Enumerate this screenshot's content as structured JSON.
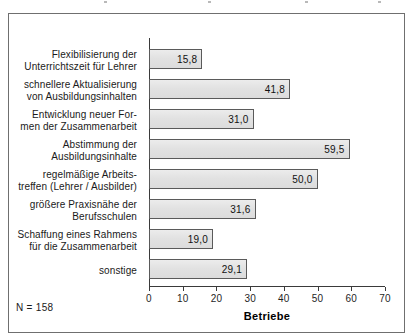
{
  "footnote": "N = 158",
  "axis": {
    "title": "Betriebe",
    "ticks": [
      "0",
      "10",
      "20",
      "30",
      "40",
      "50",
      "60",
      "70"
    ]
  },
  "colors": {
    "bar_fill": "#e4e4e4",
    "bar_border": "#5a5a5a",
    "frame": "#6f6f6f",
    "axis": "#3a3a3a",
    "text": "#1a1a1a"
  },
  "chart_data": {
    "type": "bar",
    "orientation": "horizontal",
    "title": "",
    "xlabel": "Betriebe",
    "ylabel": "",
    "xlim": [
      0,
      70
    ],
    "xticks": [
      0,
      10,
      20,
      30,
      40,
      50,
      60,
      70
    ],
    "grid": false,
    "legend": null,
    "note": "N = 158",
    "decimal_separator": ",",
    "categories": [
      "Flexibilisierung der Unterrichtszeit für Lehrer",
      "schnellere Aktualisierung von Ausbildungsinhalten",
      "Entwicklung neuer Formen der Zusammenarbeit",
      "Abstimmung der Ausbildungsinhalte",
      "regelmäßige Arbeitstreffen (Lehrer / Ausbilder)",
      "größere Praxisnähe der Berufsschulen",
      "Schaffung eines Rahmens für die Zusammenarbeit",
      "sonstige"
    ],
    "values": [
      15.8,
      41.8,
      31.0,
      59.5,
      50.0,
      31.6,
      19.0,
      29.1
    ],
    "value_labels": [
      "15,8",
      "41,8",
      "31,0",
      "59,5",
      "50,0",
      "31,6",
      "19,0",
      "29,1"
    ]
  },
  "rows": [
    {
      "line1": "Flexibilisierung der",
      "line2": "Unterrichtszeit für Lehrer",
      "value": 15.8,
      "value_label": "15,8"
    },
    {
      "line1": "schnellere Aktualisierung",
      "line2": "von Ausbildungsinhalten",
      "value": 41.8,
      "value_label": "41,8"
    },
    {
      "line1": "Entwicklung neuer For-",
      "line2": "men der Zusammenarbeit",
      "value": 31.0,
      "value_label": "31,0"
    },
    {
      "line1": "Abstimmung der",
      "line2": "Ausbildungsinhalte",
      "value": 59.5,
      "value_label": "59,5"
    },
    {
      "line1": "regelmäßige Arbeits-",
      "line2": "treffen (Lehrer / Ausbilder)",
      "value": 50.0,
      "value_label": "50,0"
    },
    {
      "line1": "größere Praxisnähe der",
      "line2": "Berufsschulen",
      "value": 31.6,
      "value_label": "31,6"
    },
    {
      "line1": "Schaffung eines Rahmens",
      "line2": "für die Zusammenarbeit",
      "value": 19.0,
      "value_label": "19,0"
    },
    {
      "line1": "sonstige",
      "line2": "",
      "value": 29.1,
      "value_label": "29,1"
    }
  ]
}
